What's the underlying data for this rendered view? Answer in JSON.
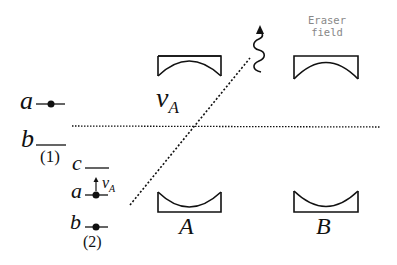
{
  "diagram": {
    "colors": {
      "line": "#111111",
      "eraser_text": "#888888",
      "background": "#ffffff"
    },
    "eraser_label": {
      "line1": "Eraser",
      "line2": "field"
    },
    "velocity_label": {
      "symbol": "v",
      "subscript": "A"
    },
    "detector_labels": {
      "A": "A",
      "B": "B"
    },
    "panel1": {
      "label": "(1)",
      "levels": [
        {
          "name": "a",
          "has_dot": true
        },
        {
          "name": "b",
          "has_dot": false
        }
      ]
    },
    "panel2": {
      "label": "(2)",
      "levels": [
        {
          "name": "c",
          "has_dot": false
        },
        {
          "name": "a",
          "has_dot": true,
          "arrow_label_symbol": "v",
          "arrow_label_subscript": "A"
        },
        {
          "name": "b",
          "has_dot": true
        }
      ]
    },
    "icons": {
      "photon": "wavy-arrow-icon",
      "cavity": "mirror-cavity-icon"
    }
  }
}
